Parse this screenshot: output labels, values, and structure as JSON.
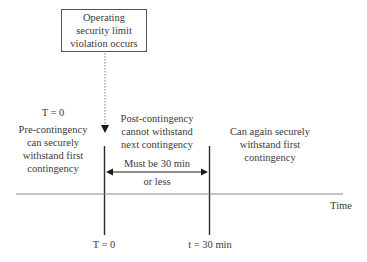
{
  "diagram": {
    "event_box": {
      "lines": [
        "Operating",
        "security limit",
        "violation occurs"
      ]
    },
    "top_time_label": "T = 0",
    "pre_contingency": {
      "lines": [
        "Pre-contingency",
        "can securely",
        "withstand first",
        "contingency"
      ]
    },
    "post_contingency": {
      "lines": [
        "Post-contingency",
        "cannot withstand",
        "next contingency"
      ]
    },
    "recovered": {
      "lines": [
        "Can again securely",
        "withstand first",
        "contingency"
      ]
    },
    "interval": {
      "lines": [
        "Must be 30 min",
        "or less"
      ]
    },
    "axis_label": "Time",
    "markers": [
      {
        "label": "T = 0"
      },
      {
        "label": "t = 30 min"
      }
    ],
    "colors": {
      "line": "#2a2a2a",
      "dashed": "#999999",
      "text": "#3a3a3a"
    }
  }
}
